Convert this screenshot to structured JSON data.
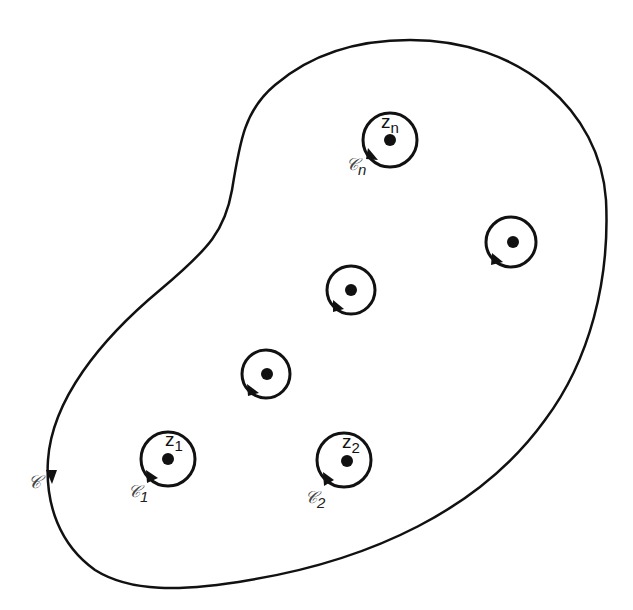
{
  "diagram": {
    "type": "contour-with-singularities",
    "colors": {
      "stroke": "#111111",
      "background": "#ffffff"
    },
    "outer_contour": {
      "label": "C",
      "label_script": "𝒞",
      "orientation": "clockwise-arrow-downward-on-left"
    },
    "singularities": [
      {
        "id": "zn",
        "point_label": "z",
        "point_sub": "n",
        "contour_label": "𝒞",
        "contour_sub": "n",
        "cx": 390,
        "cy": 140
      },
      {
        "id": "right",
        "point_label": "",
        "point_sub": "",
        "contour_label": "",
        "contour_sub": "",
        "cx": 511,
        "cy": 242
      },
      {
        "id": "middle",
        "point_label": "",
        "point_sub": "",
        "contour_label": "",
        "contour_sub": "",
        "cx": 350,
        "cy": 290
      },
      {
        "id": "left-middle",
        "point_label": "",
        "point_sub": "",
        "contour_label": "",
        "contour_sub": "",
        "cx": 265,
        "cy": 374
      },
      {
        "id": "z1",
        "point_label": "z",
        "point_sub": "1",
        "contour_label": "𝒞",
        "contour_sub": "1",
        "cx": 168,
        "cy": 459
      },
      {
        "id": "z2",
        "point_label": "z",
        "point_sub": "2",
        "contour_label": "𝒞",
        "contour_sub": "2",
        "cx": 346,
        "cy": 460
      }
    ]
  }
}
